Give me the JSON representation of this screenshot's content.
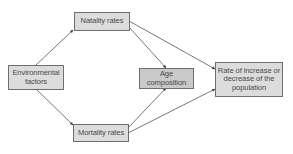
{
  "diagram": {
    "type": "flowchart",
    "colors": {
      "node_fill": "#dcdcdc",
      "highlight_fill": "#c9c9c9",
      "border": "#6e6e6e",
      "text": "#4a4a4a",
      "edge": "#555555"
    },
    "nodes": [
      {
        "id": "environmental",
        "label": "Environmental factors",
        "line1": "Environmental",
        "line2": "factors"
      },
      {
        "id": "natality",
        "label": "Natality rates"
      },
      {
        "id": "mortality",
        "label": "Mortality rates"
      },
      {
        "id": "age",
        "label": "Age composition",
        "line1": "Age",
        "line2": "composition"
      },
      {
        "id": "rate",
        "label": "Rate of increase or decrease of the population",
        "line1": "Rate of increase or",
        "line2": "decrease of the",
        "line3": "population"
      }
    ],
    "edges": [
      {
        "from": "environmental",
        "to": "natality"
      },
      {
        "from": "environmental",
        "to": "mortality"
      },
      {
        "from": "natality",
        "to": "age"
      },
      {
        "from": "natality",
        "to": "rate"
      },
      {
        "from": "mortality",
        "to": "age"
      },
      {
        "from": "mortality",
        "to": "rate"
      }
    ]
  }
}
